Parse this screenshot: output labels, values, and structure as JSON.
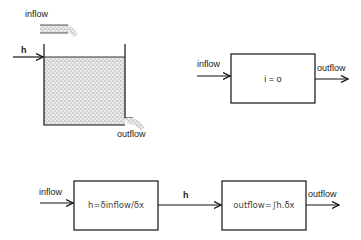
{
  "tank": {
    "inflow_label": "inflow",
    "h_label": "h",
    "outflow_label": "outflow"
  },
  "simple_model": {
    "inflow_label": "inflow",
    "box_equation": "i = o",
    "outflow_label": "outflow"
  },
  "chain_model": {
    "inflow_label": "inflow",
    "box1_equation": "h=δinflow/δx",
    "h_label": "h",
    "box2_equation": "outflow=∫h.δx",
    "outflow_label": "outflow"
  },
  "colors": {
    "line": "#111111",
    "fill_stipple": "#bdbdbd",
    "background": "#ffffff"
  }
}
